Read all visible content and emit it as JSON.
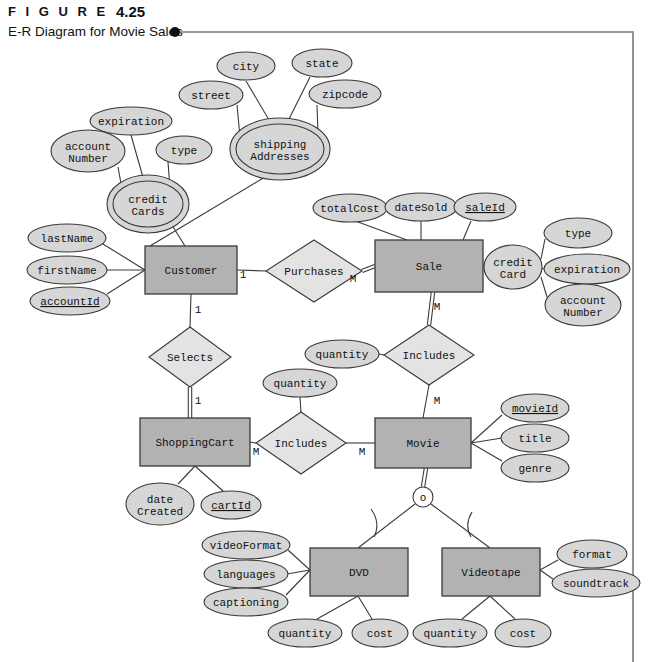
{
  "figure": {
    "kicker": "F I G U R E",
    "number": "4.25",
    "caption": "E-R Diagram for Movie Sales"
  },
  "colors": {
    "entity_fill": "#b2b2b2",
    "relationship_fill": "#e3e3e3",
    "attribute_fill": "#d6d6d6",
    "stroke": "#3a3a3a",
    "frame": "#7a7a7a",
    "text": "#111111"
  },
  "diagram": {
    "type": "er-diagram",
    "entities": [
      {
        "id": "customer",
        "label": "Customer",
        "x": 145,
        "y": 246,
        "w": 92,
        "h": 48
      },
      {
        "id": "sale",
        "label": "Sale",
        "x": 375,
        "y": 240,
        "w": 108,
        "h": 52
      },
      {
        "id": "shoppingcart",
        "label": "ShoppingCart",
        "x": 140,
        "y": 418,
        "w": 110,
        "h": 48
      },
      {
        "id": "movie",
        "label": "Movie",
        "x": 375,
        "y": 418,
        "w": 96,
        "h": 50
      },
      {
        "id": "dvd",
        "label": "DVD",
        "x": 310,
        "y": 548,
        "w": 98,
        "h": 48
      },
      {
        "id": "videotape",
        "label": "Videotape",
        "x": 442,
        "y": 548,
        "w": 98,
        "h": 48
      }
    ],
    "relationships": [
      {
        "id": "purchases",
        "label": "Purchases",
        "cx": 314,
        "cy": 271,
        "rx": 48,
        "ry": 31
      },
      {
        "id": "selects",
        "label": "Selects",
        "cx": 190,
        "cy": 357,
        "rx": 41,
        "ry": 30
      },
      {
        "id": "includes-sale",
        "label": "Includes",
        "cx": 429,
        "cy": 355,
        "rx": 45,
        "ry": 30
      },
      {
        "id": "includes-cart",
        "label": "Includes",
        "cx": 301,
        "cy": 443,
        "rx": 45,
        "ry": 31
      }
    ],
    "attributes": [
      {
        "id": "city",
        "label": "city",
        "cx": 246,
        "cy": 66,
        "rx": 29,
        "ry": 14,
        "key": false,
        "multi": false
      },
      {
        "id": "state",
        "label": "state",
        "cx": 322,
        "cy": 63,
        "rx": 30,
        "ry": 14,
        "key": false,
        "multi": false
      },
      {
        "id": "street",
        "label": "street",
        "cx": 211,
        "cy": 95,
        "rx": 32,
        "ry": 14,
        "key": false,
        "multi": false
      },
      {
        "id": "zipcode",
        "label": "zipcode",
        "cx": 345,
        "cy": 94,
        "rx": 36,
        "ry": 14,
        "key": false,
        "multi": false
      },
      {
        "id": "shippingaddr",
        "label": "shipping|Addresses",
        "cx": 280,
        "cy": 149,
        "rx": 44,
        "ry": 25,
        "key": false,
        "multi": true
      },
      {
        "id": "expiration1",
        "label": "expiration",
        "cx": 131,
        "cy": 121,
        "rx": 41,
        "ry": 14,
        "key": false,
        "multi": false
      },
      {
        "id": "accountnum1",
        "label": "account|Number",
        "cx": 88,
        "cy": 151,
        "rx": 37,
        "ry": 21,
        "key": false,
        "multi": false
      },
      {
        "id": "type1",
        "label": "type",
        "cx": 184,
        "cy": 150,
        "rx": 28,
        "ry": 14,
        "key": false,
        "multi": false
      },
      {
        "id": "creditcards",
        "label": "credit|Cards",
        "cx": 148,
        "cy": 204,
        "rx": 35,
        "ry": 23,
        "key": false,
        "multi": true
      },
      {
        "id": "lastname",
        "label": "lastName",
        "cx": 67,
        "cy": 238,
        "rx": 39,
        "ry": 14,
        "key": false,
        "multi": false
      },
      {
        "id": "firstname",
        "label": "firstName",
        "cx": 67,
        "cy": 270,
        "rx": 40,
        "ry": 14,
        "key": false,
        "multi": false
      },
      {
        "id": "accountid",
        "label": "accountId",
        "cx": 70,
        "cy": 301,
        "rx": 40,
        "ry": 14,
        "key": true,
        "multi": false
      },
      {
        "id": "totalcost",
        "label": "totalCost",
        "cx": 350,
        "cy": 208,
        "rx": 37,
        "ry": 14,
        "key": false,
        "multi": false
      },
      {
        "id": "datesold",
        "label": "dateSold",
        "cx": 421,
        "cy": 207,
        "rx": 36,
        "ry": 14,
        "key": false,
        "multi": false
      },
      {
        "id": "saleid",
        "label": "saleId",
        "cx": 485,
        "cy": 207,
        "rx": 31,
        "ry": 14,
        "key": true,
        "multi": false
      },
      {
        "id": "creditcard",
        "label": "credit|Card",
        "cx": 513,
        "cy": 267,
        "rx": 29,
        "ry": 22,
        "key": false,
        "multi": false
      },
      {
        "id": "type2",
        "label": "type",
        "cx": 578,
        "cy": 233,
        "rx": 34,
        "ry": 15,
        "key": false,
        "multi": false
      },
      {
        "id": "expiration2",
        "label": "expiration",
        "cx": 587,
        "cy": 269,
        "rx": 43,
        "ry": 15,
        "key": false,
        "multi": false
      },
      {
        "id": "accountnum2",
        "label": "account|Number",
        "cx": 583,
        "cy": 305,
        "rx": 38,
        "ry": 21,
        "key": false,
        "multi": false
      },
      {
        "id": "qty-sale",
        "label": "quantity",
        "cx": 342,
        "cy": 354,
        "rx": 37,
        "ry": 14,
        "key": false,
        "multi": false
      },
      {
        "id": "qty-cart",
        "label": "quantity",
        "cx": 300,
        "cy": 383,
        "rx": 37,
        "ry": 14,
        "key": false,
        "multi": false
      },
      {
        "id": "datecreated",
        "label": "date|Created",
        "cx": 160,
        "cy": 504,
        "rx": 34,
        "ry": 21,
        "key": false,
        "multi": false
      },
      {
        "id": "cartid",
        "label": "cartId",
        "cx": 231,
        "cy": 505,
        "rx": 30,
        "ry": 14,
        "key": true,
        "multi": false
      },
      {
        "id": "movieid",
        "label": "movieId",
        "cx": 535,
        "cy": 408,
        "rx": 34,
        "ry": 14,
        "key": true,
        "multi": false
      },
      {
        "id": "title",
        "label": "title",
        "cx": 535,
        "cy": 438,
        "rx": 34,
        "ry": 14,
        "key": false,
        "multi": false
      },
      {
        "id": "genre",
        "label": "genre",
        "cx": 535,
        "cy": 468,
        "rx": 34,
        "ry": 14,
        "key": false,
        "multi": false
      },
      {
        "id": "videoformat",
        "label": "videoFormat",
        "cx": 246,
        "cy": 545,
        "rx": 44,
        "ry": 14,
        "key": false,
        "multi": false
      },
      {
        "id": "languages",
        "label": "languages",
        "cx": 246,
        "cy": 574,
        "rx": 42,
        "ry": 14,
        "key": false,
        "multi": false
      },
      {
        "id": "captioning",
        "label": "captioning",
        "cx": 246,
        "cy": 602,
        "rx": 42,
        "ry": 14,
        "key": false,
        "multi": false
      },
      {
        "id": "format",
        "label": "format",
        "cx": 592,
        "cy": 554,
        "rx": 35,
        "ry": 14,
        "key": false,
        "multi": false
      },
      {
        "id": "soundtrack",
        "label": "soundtrack",
        "cx": 596,
        "cy": 583,
        "rx": 44,
        "ry": 14,
        "key": false,
        "multi": false
      },
      {
        "id": "dvd-qty",
        "label": "quantity",
        "cx": 305,
        "cy": 633,
        "rx": 37,
        "ry": 14,
        "key": false,
        "multi": false
      },
      {
        "id": "dvd-cost",
        "label": "cost",
        "cx": 380,
        "cy": 633,
        "rx": 28,
        "ry": 14,
        "key": false,
        "multi": false
      },
      {
        "id": "vhs-qty",
        "label": "quantity",
        "cx": 450,
        "cy": 633,
        "rx": 37,
        "ry": 14,
        "key": false,
        "multi": false
      },
      {
        "id": "vhs-cost",
        "label": "cost",
        "cx": 523,
        "cy": 633,
        "rx": 28,
        "ry": 14,
        "key": false,
        "multi": false
      }
    ],
    "specialization": {
      "id": "overlap-circle",
      "label": "o",
      "cx": 423,
      "cy": 497,
      "r": 10
    },
    "cardinalities": [
      {
        "id": "card-cust-purch",
        "label": "1",
        "x": 243,
        "y": 278
      },
      {
        "id": "card-purch-sale",
        "label": "M",
        "x": 353,
        "y": 282
      },
      {
        "id": "card-cust-sel",
        "label": "1",
        "x": 198,
        "y": 313
      },
      {
        "id": "card-sel-cart",
        "label": "1",
        "x": 198,
        "y": 404
      },
      {
        "id": "card-sale-inc",
        "label": "M",
        "x": 437,
        "y": 310
      },
      {
        "id": "card-inc-movie",
        "label": "M",
        "x": 437,
        "y": 404
      },
      {
        "id": "card-cart-inc",
        "label": "M",
        "x": 256,
        "y": 455
      },
      {
        "id": "card-inc-mov2",
        "label": "M",
        "x": 362,
        "y": 455
      }
    ]
  }
}
